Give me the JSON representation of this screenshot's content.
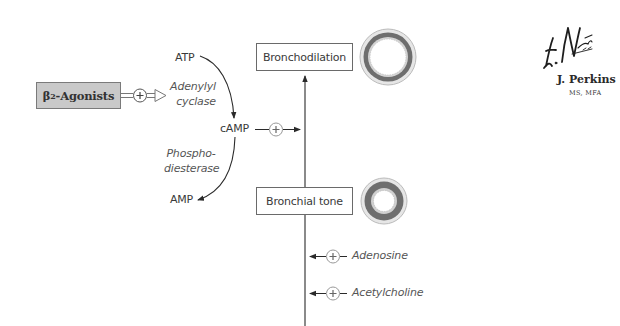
{
  "diagram": {
    "drug": {
      "label_prefix": "β",
      "label_sub": "2",
      "label_suffix": "-Agonists",
      "effect": "+"
    },
    "pathway": {
      "substrate": "ATP",
      "enzyme1_line1": "Adenylyl",
      "enzyme1_line2": "cyclase",
      "intermediate": "cAMP",
      "intermediate_effect": "+",
      "enzyme2_line1": "Phospho-",
      "enzyme2_line2": "diesterase",
      "product": "AMP"
    },
    "states": [
      {
        "label": "Bronchodilation",
        "airway": "dilated"
      },
      {
        "label": "Bronchial tone",
        "airway": "normal"
      },
      {
        "label": "Bronchospasm",
        "airway": "constricted"
      }
    ],
    "modulators": [
      {
        "label": "Adenosine",
        "effect": "+"
      },
      {
        "label": "Acetylcholine",
        "effect": "+"
      }
    ],
    "colors": {
      "agonist_fill": "#c9c9c9",
      "muscle_ring": "#6e6e6e",
      "outer_ring": "#bdbdbd",
      "line": "#2a2a2a"
    }
  },
  "signature": {
    "artist_script": "F. Netter M.D.",
    "name": "J. Perkins",
    "credentials": "MS, MFA"
  }
}
